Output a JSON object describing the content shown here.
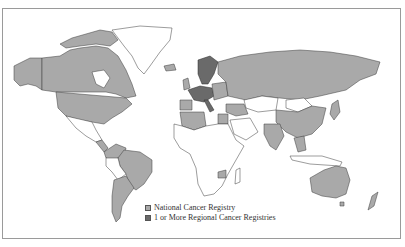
{
  "map": {
    "type": "choropleth-world",
    "colors": {
      "national": "#a9a9a9",
      "regional": "#6a6a6a",
      "none": "#ffffff",
      "border": "#3a3a3a",
      "frame": "#9a9a9a"
    }
  },
  "legend": {
    "items": [
      {
        "label": "National Cancer Registry",
        "color": "#a9a9a9"
      },
      {
        "label": "1 or More Regional Cancer Registries",
        "color": "#6a6a6a"
      }
    ]
  }
}
